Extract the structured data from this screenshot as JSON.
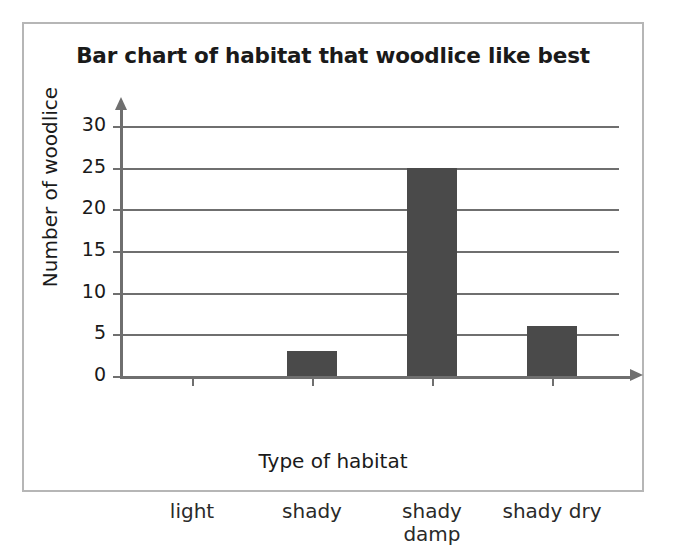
{
  "figure": {
    "border_color": "#b6b6b6",
    "background": "#ffffff"
  },
  "chart_data": {
    "type": "bar",
    "title": "Bar chart of habitat that woodlice like best",
    "xlabel": "Type of habitat",
    "ylabel": "Number of woodlice",
    "categories": [
      "light",
      "shady",
      "shady damp",
      "shady dry"
    ],
    "category_lines": [
      [
        "light"
      ],
      [
        "shady"
      ],
      [
        "shady",
        "damp"
      ],
      [
        "shady dry"
      ]
    ],
    "values": [
      0,
      3,
      25,
      6
    ],
    "ylim": [
      0,
      30
    ],
    "yticks": [
      0,
      5,
      10,
      15,
      20,
      25,
      30
    ],
    "ytick_labels": [
      "0",
      "5",
      "10",
      "15",
      "20",
      "25",
      "30"
    ],
    "grid": "horizontal",
    "legend": "none",
    "bar_color": "#4a4a4a",
    "axis_color": "#6f6f6f",
    "text_color": "#1a1a1a"
  }
}
